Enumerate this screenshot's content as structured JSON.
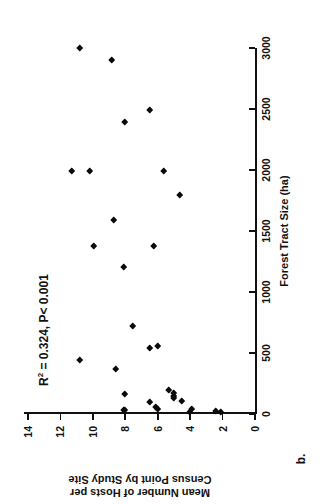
{
  "panel": {
    "label": "b."
  },
  "annotation": {
    "prefix": "R",
    "superscript": "2",
    "text": " = 0.324, P< 0.001"
  },
  "chart_data": {
    "type": "scatter",
    "title": "",
    "subtitle": "",
    "xlabel": "Forest Tract Size (ha)",
    "ylabel": "Mean Number of Hosts per Census Point by Study Site",
    "xlim": [
      0,
      3000
    ],
    "ylim": [
      0,
      14
    ],
    "xticks": [
      0,
      500,
      1000,
      1500,
      2000,
      2500,
      3000
    ],
    "xtick_labels": [
      "0",
      "500",
      "1000",
      "1500",
      "2000",
      "2500",
      "3000"
    ],
    "yticks": [
      0,
      2,
      4,
      6,
      8,
      10,
      12,
      14
    ],
    "ytick_labels": [
      "0",
      "2",
      "4",
      "6",
      "8",
      "10",
      "12",
      "14"
    ],
    "grid": false,
    "legend": null,
    "marker": "diamond",
    "marker_color": "#0a0a0a",
    "annotations": [
      {
        "text": "R2 = 0.324, P< 0.001",
        "x": 350,
        "y": 13.2
      }
    ],
    "points": [
      {
        "x": 3000,
        "y": 10.8
      },
      {
        "x": 2900,
        "y": 8.8
      },
      {
        "x": 2490,
        "y": 6.5
      },
      {
        "x": 2390,
        "y": 8.0
      },
      {
        "x": 1990,
        "y": 11.3
      },
      {
        "x": 1990,
        "y": 10.2
      },
      {
        "x": 1990,
        "y": 5.6
      },
      {
        "x": 1795,
        "y": 4.6
      },
      {
        "x": 1590,
        "y": 8.7
      },
      {
        "x": 1375,
        "y": 9.9
      },
      {
        "x": 1375,
        "y": 6.2
      },
      {
        "x": 1205,
        "y": 8.1
      },
      {
        "x": 725,
        "y": 7.5
      },
      {
        "x": 545,
        "y": 6.5
      },
      {
        "x": 560,
        "y": 6.0
      },
      {
        "x": 440,
        "y": 10.8
      },
      {
        "x": 370,
        "y": 8.6
      },
      {
        "x": 165,
        "y": 8.0
      },
      {
        "x": 200,
        "y": 5.3
      },
      {
        "x": 175,
        "y": 5.0
      },
      {
        "x": 150,
        "y": 5.0
      },
      {
        "x": 130,
        "y": 5.0
      },
      {
        "x": 105,
        "y": 4.5
      },
      {
        "x": 95,
        "y": 6.5
      },
      {
        "x": 60,
        "y": 6.1
      },
      {
        "x": 45,
        "y": 6.0
      },
      {
        "x": 35,
        "y": 8.1
      },
      {
        "x": 30,
        "y": 8.0
      },
      {
        "x": 45,
        "y": 3.9
      },
      {
        "x": 25,
        "y": 2.4
      },
      {
        "x": 20,
        "y": 2.1
      },
      {
        "x": 15,
        "y": 4.0
      }
    ]
  }
}
